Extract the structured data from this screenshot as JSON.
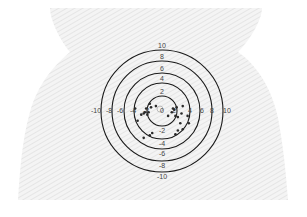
{
  "diagram": {
    "center": {
      "x": 162,
      "y": 111
    },
    "colors": {
      "ring": "#1a1a1a",
      "dot": "#2a2a2a",
      "label": "#444444",
      "skin_hatch": "#d8d8d8",
      "background": "#ffffff"
    },
    "rings": [
      {
        "label_top": "2",
        "label_bottom": "-2",
        "r": 15
      },
      {
        "label_top": "4",
        "label_bottom": "-4",
        "r": 28
      },
      {
        "label_top": "6",
        "label_bottom": "-6",
        "r": 38
      },
      {
        "label_top": "8",
        "label_bottom": "-8",
        "r": 50
      },
      {
        "label_top": "10",
        "label_bottom": "-10",
        "r": 61
      }
    ],
    "top_labels": [
      "10",
      "8",
      "6",
      "4",
      "2"
    ],
    "bottom_labels": [
      "-2",
      "-4",
      "-6",
      "-8",
      "-10"
    ],
    "left_labels": [
      "-10",
      "-8",
      "-6",
      "-4",
      "-2"
    ],
    "right_labels": [
      "2",
      "4",
      "6",
      "8",
      "10"
    ],
    "center_label": "0",
    "points": [
      [
        -2.6,
        0.4
      ],
      [
        -2.8,
        -0.2
      ],
      [
        -3.0,
        -0.4
      ],
      [
        -2.4,
        -0.6
      ],
      [
        -2.2,
        -0.2
      ],
      [
        -3.4,
        -0.6
      ],
      [
        -4.4,
        0.4
      ],
      [
        -4.0,
        -1.6
      ],
      [
        -1.8,
        0.6
      ],
      [
        -2.0,
        1.2
      ],
      [
        1.8,
        0.4
      ],
      [
        2.0,
        0.2
      ],
      [
        2.4,
        0.6
      ],
      [
        1.6,
        -0.2
      ],
      [
        2.2,
        -0.8
      ],
      [
        2.6,
        -1.0
      ],
      [
        3.4,
        0.8
      ],
      [
        3.2,
        -0.4
      ],
      [
        4.2,
        -0.8
      ],
      [
        4.4,
        -2.0
      ],
      [
        3.0,
        -2.0
      ],
      [
        2.6,
        -3.2
      ],
      [
        2.2,
        -3.8
      ],
      [
        -1.6,
        -3.6
      ],
      [
        -2.0,
        -4.0
      ],
      [
        -3.0,
        -4.4
      ],
      [
        3.4,
        -3.0
      ],
      [
        1.0,
        -0.8
      ],
      [
        -1.0,
        0.8
      ]
    ]
  }
}
